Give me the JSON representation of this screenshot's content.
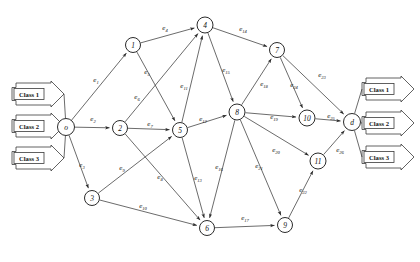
{
  "diagram": {
    "colors": {
      "stroke": "#2b2b2b",
      "node_fill": "#ffffff",
      "background": "#ffffff"
    },
    "nodes": [
      {
        "id": "o",
        "label": "o",
        "x": 66,
        "y": 127,
        "r": 8.5
      },
      {
        "id": "1",
        "label": "1",
        "x": 133,
        "y": 45,
        "r": 7.5
      },
      {
        "id": "2",
        "label": "2",
        "x": 120,
        "y": 128,
        "r": 7.5
      },
      {
        "id": "3",
        "label": "3",
        "x": 92,
        "y": 198,
        "r": 7.5
      },
      {
        "id": "4",
        "label": "4",
        "x": 205,
        "y": 25,
        "r": 8.0
      },
      {
        "id": "5",
        "label": "5",
        "x": 180,
        "y": 130,
        "r": 7.5
      },
      {
        "id": "6",
        "label": "6",
        "x": 207,
        "y": 228,
        "r": 7.5
      },
      {
        "id": "7",
        "label": "7",
        "x": 277,
        "y": 50,
        "r": 7.5
      },
      {
        "id": "8",
        "label": "8",
        "x": 237,
        "y": 112,
        "r": 8.0
      },
      {
        "id": "9",
        "label": "9",
        "x": 285,
        "y": 225,
        "r": 7.5
      },
      {
        "id": "10",
        "label": "10",
        "x": 307,
        "y": 118,
        "r": 8.0
      },
      {
        "id": "11",
        "label": "11",
        "x": 318,
        "y": 161,
        "r": 8.0
      },
      {
        "id": "d",
        "label": "d",
        "x": 352,
        "y": 122,
        "r": 8.5
      }
    ],
    "edges": [
      {
        "id": "e1",
        "base": "e",
        "sub": "1",
        "from": "o",
        "to": "1",
        "lx": 96,
        "ly": 80
      },
      {
        "id": "e2",
        "base": "e",
        "sub": "2",
        "from": "o",
        "to": "2",
        "lx": 93,
        "ly": 119
      },
      {
        "id": "e3",
        "base": "e",
        "sub": "3",
        "from": "o",
        "to": "3",
        "lx": 82,
        "ly": 165
      },
      {
        "id": "e4",
        "base": "e",
        "sub": "4",
        "from": "1",
        "to": "4",
        "lx": 165,
        "ly": 28
      },
      {
        "id": "e5",
        "base": "e",
        "sub": "5",
        "from": "1",
        "to": "5",
        "lx": 147,
        "ly": 72
      },
      {
        "id": "e6",
        "base": "e",
        "sub": "6",
        "from": "2",
        "to": "4",
        "lx": 137,
        "ly": 97
      },
      {
        "id": "e7",
        "base": "e",
        "sub": "7",
        "from": "2",
        "to": "5",
        "lx": 150,
        "ly": 124
      },
      {
        "id": "e8",
        "base": "e",
        "sub": "8",
        "from": "2",
        "to": "6",
        "lx": 160,
        "ly": 177
      },
      {
        "id": "e9",
        "base": "e",
        "sub": "9",
        "from": "3",
        "to": "5",
        "lx": 122,
        "ly": 168
      },
      {
        "id": "e10",
        "base": "e",
        "sub": "10",
        "from": "3",
        "to": "6",
        "lx": 143,
        "ly": 206
      },
      {
        "id": "e11",
        "base": "e",
        "sub": "11",
        "from": "5",
        "to": "4",
        "lx": 184,
        "ly": 86
      },
      {
        "id": "e12",
        "base": "e",
        "sub": "12",
        "from": "5",
        "to": "8",
        "lx": 203,
        "ly": 119
      },
      {
        "id": "e13",
        "base": "e",
        "sub": "13",
        "from": "5",
        "to": "6",
        "lx": 198,
        "ly": 178
      },
      {
        "id": "e14",
        "base": "e",
        "sub": "14",
        "from": "4",
        "to": "7",
        "lx": 243,
        "ly": 29
      },
      {
        "id": "e15",
        "base": "e",
        "sub": "15",
        "from": "4",
        "to": "8",
        "lx": 226,
        "ly": 70
      },
      {
        "id": "e16",
        "base": "e",
        "sub": "16",
        "from": "8",
        "to": "6",
        "lx": 219,
        "ly": 167
      },
      {
        "id": "e17",
        "base": "e",
        "sub": "17",
        "from": "6",
        "to": "9",
        "lx": 245,
        "ly": 218
      },
      {
        "id": "e18",
        "base": "e",
        "sub": "18",
        "from": "8",
        "to": "7",
        "lx": 264,
        "ly": 84
      },
      {
        "id": "e19",
        "base": "e",
        "sub": "19",
        "from": "8",
        "to": "10",
        "lx": 274,
        "ly": 117
      },
      {
        "id": "e20",
        "base": "e",
        "sub": "20",
        "from": "8",
        "to": "11",
        "lx": 276,
        "ly": 150
      },
      {
        "id": "e21",
        "base": "e",
        "sub": "21",
        "from": "8",
        "to": "9",
        "lx": 259,
        "ly": 166
      },
      {
        "id": "e22",
        "base": "e",
        "sub": "22",
        "from": "9",
        "to": "11",
        "lx": 303,
        "ly": 190
      },
      {
        "id": "e23",
        "base": "e",
        "sub": "23",
        "from": "7",
        "to": "d",
        "lx": 322,
        "ly": 75
      },
      {
        "id": "e24",
        "base": "e",
        "sub": "24",
        "from": "7",
        "to": "10",
        "lx": 294,
        "ly": 85
      },
      {
        "id": "e25",
        "base": "e",
        "sub": "25",
        "from": "10",
        "to": "d",
        "lx": 331,
        "ly": 116
      },
      {
        "id": "e26",
        "base": "e",
        "sub": "26",
        "from": "11",
        "to": "d",
        "lx": 340,
        "ly": 150
      }
    ],
    "inputs": {
      "side": "left",
      "items": [
        {
          "label": "Class 1",
          "x": 12,
          "y": 83,
          "w": 52,
          "h": 22
        },
        {
          "label": "Class 2",
          "x": 12,
          "y": 115,
          "w": 52,
          "h": 22
        },
        {
          "label": "Class 3",
          "x": 12,
          "y": 147,
          "w": 52,
          "h": 22
        }
      ]
    },
    "outputs": {
      "side": "right",
      "items": [
        {
          "label": "Class 1",
          "x": 362,
          "y": 78,
          "w": 52,
          "h": 22
        },
        {
          "label": "Class 2",
          "x": 362,
          "y": 112,
          "w": 52,
          "h": 22
        },
        {
          "label": "Class 3",
          "x": 362,
          "y": 146,
          "w": 52,
          "h": 22
        }
      ]
    }
  }
}
